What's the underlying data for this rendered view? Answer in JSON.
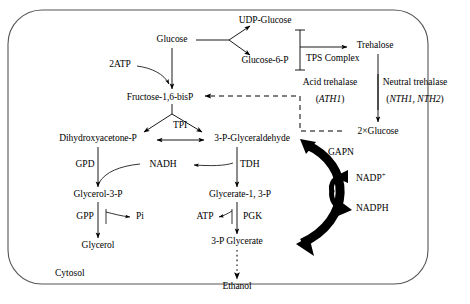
{
  "diagram": {
    "compartment_label": "Cytosol",
    "border_color": "#555555",
    "text_color": "#000000",
    "metabolites": [
      {
        "id": "glucose",
        "label": "Glucose",
        "x": 172,
        "y": 41
      },
      {
        "id": "udp_glucose",
        "label": "UDP-Glucose",
        "x": 265,
        "y": 22
      },
      {
        "id": "glucose_6_p",
        "label": "Glucose-6-P",
        "x": 265,
        "y": 62
      },
      {
        "id": "trehalose",
        "label": "Trehalose",
        "x": 375,
        "y": 47
      },
      {
        "id": "two_glucose",
        "label": "2×Glucose",
        "x": 378,
        "y": 133
      },
      {
        "id": "fructose16bisp",
        "label": "Fructose-1,6-bisP",
        "x": 160,
        "y": 99
      },
      {
        "id": "dhap",
        "label": "Dihydroxyacetone-P",
        "x": 98,
        "y": 140
      },
      {
        "id": "g3p",
        "label": "3-P-Glyceraldehyde",
        "x": 252,
        "y": 140
      },
      {
        "id": "nadh",
        "label": "NADH",
        "x": 163,
        "y": 166
      },
      {
        "id": "glycerol_3_p",
        "label": "Glycerol-3-P",
        "x": 98,
        "y": 196
      },
      {
        "id": "glycerate13p",
        "label": "Glycerate-1, 3-P",
        "x": 240,
        "y": 196
      },
      {
        "id": "pi",
        "label": "Pi",
        "x": 140,
        "y": 218
      },
      {
        "id": "glycerol",
        "label": "Glycerol",
        "x": 98,
        "y": 247
      },
      {
        "id": "three_p_glyc",
        "label": "3-P Glycerate",
        "x": 237,
        "y": 243
      },
      {
        "id": "ethanol",
        "label": "Ethanol",
        "x": 237,
        "y": 288
      },
      {
        "id": "nadp_plus",
        "label": "NADP",
        "x": 350,
        "y": 178,
        "superscript": "+"
      },
      {
        "id": "nadph",
        "label": "NADPH",
        "x": 350,
        "y": 210
      }
    ],
    "enzymes": [
      {
        "id": "two_atp",
        "label": "2ATP",
        "x": 120,
        "y": 66
      },
      {
        "id": "tps",
        "label": "TPS Complex",
        "x": 307,
        "y": 60
      },
      {
        "id": "acid_treh",
        "label": "Acid trehalase",
        "x": 330,
        "y": 84
      },
      {
        "id": "ath1",
        "label": "ATH1",
        "x": 330,
        "y": 101,
        "italic": true,
        "paren": true
      },
      {
        "id": "neut_treh",
        "label": "Neutral trehalase",
        "x": 415,
        "y": 84
      },
      {
        "id": "nth",
        "label": "NTH1, NTH2",
        "x": 415,
        "y": 101,
        "italic": true,
        "paren": true
      },
      {
        "id": "tpi",
        "label": "TPI",
        "x": 168,
        "y": 127
      },
      {
        "id": "gapn",
        "label": "GAPN",
        "x": 330,
        "y": 154
      },
      {
        "id": "gpd",
        "label": "GPD",
        "x": 85,
        "y": 166
      },
      {
        "id": "tdh",
        "label": "TDH",
        "x": 243,
        "y": 166
      },
      {
        "id": "gpp",
        "label": "GPP",
        "x": 85,
        "y": 218
      },
      {
        "id": "atp",
        "label": "ATP",
        "x": 205,
        "y": 218
      },
      {
        "id": "pgk",
        "label": "PGK",
        "x": 248,
        "y": 218
      }
    ]
  }
}
